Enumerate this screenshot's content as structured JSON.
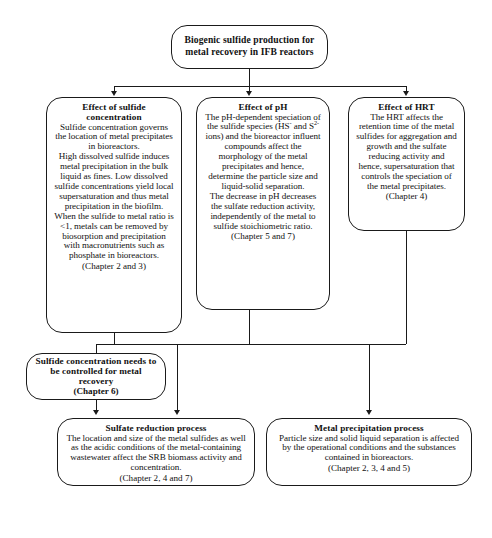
{
  "diagram": {
    "line_color": "#1a1a1a",
    "background_color": "#ffffff"
  },
  "root": {
    "title": "Biogenic sulfide production for metal recovery in IFB reactors"
  },
  "branches": [
    {
      "id": "sulfide-concentration",
      "title": "Effect of sulfide concentration",
      "paragraphs": [
        "Sulfide concentration governs the location of metal precipitates in bioreactors.",
        "High dissolved sulfide induces metal precipitation in the bulk liquid as fines. Low dissolved sulfide concentrations yield local supersaturation and thus metal precipitation in the biofilm.",
        "When the sulfide to metal ratio is <1, metals can be removed by biosorption and precipitation with macronutrients such as phosphate in bioreactors."
      ],
      "chapter": "(Chapter 2 and 3)"
    },
    {
      "id": "ph",
      "title": "Effect of pH",
      "paragraphs": [
        "The pH-dependent speciation of the sulfide species (HS- and S2- ions) and the bioreactor influent compounds affect the morphology of the metal precipitates and hence, determine the particle size and liquid-solid separation.",
        "The decrease in pH decreases the sulfate reduction activity, independently of the metal to sulfide stoichiometric ratio."
      ],
      "chapter": "(Chapter 5 and 7)"
    },
    {
      "id": "hrt",
      "title": "Effect of HRT",
      "paragraphs": [
        "The HRT affects the retention time of the metal sulfides for aggregation and growth and the sulfate reducing activity and hence, supersaturation that controls the speciation of the metal precipitates."
      ],
      "chapter": "(Chapter 4)"
    }
  ],
  "conclusion": {
    "id": "sulfide-control",
    "title": "Sulfide concentration needs to be controlled for metal recovery",
    "chapter": "(Chapter 6)"
  },
  "outcomes": [
    {
      "id": "sulfate-reduction-process",
      "title": "Sulfate reduction process",
      "paragraphs": [
        "The location and size of the metal sulfides as well as the acidic conditions of the metal-containing wastewater affect the SRB biomass activity and concentration."
      ],
      "chapter": "(Chapter 2, 4 and 7)"
    },
    {
      "id": "metal-precipitation-process",
      "title": "Metal precipitation process",
      "paragraphs": [
        "Particle size and solid liquid separation is affected by the operational conditions and the substances contained in bioreactors."
      ],
      "chapter": "(Chapter 2, 3, 4 and 5)"
    }
  ]
}
